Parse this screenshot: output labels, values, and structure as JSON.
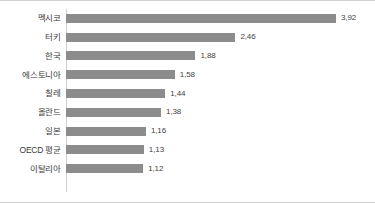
{
  "chart_data": {
    "type": "bar",
    "orientation": "horizontal",
    "title": "",
    "subtitle": "",
    "xlabel": "",
    "ylabel": "",
    "xlim": [
      0,
      4.4
    ],
    "grid": false,
    "legend": null,
    "value_label_format": "comma-decimal",
    "bar_color": "#8c8c8c",
    "categories": [
      "멕시코",
      "터키",
      "한국",
      "에스토니아",
      "칠레",
      "올란드",
      "일본",
      "OECD 평균",
      "이탈리아"
    ],
    "values": [
      3.92,
      2.46,
      1.88,
      1.58,
      1.44,
      1.38,
      1.16,
      1.13,
      1.12
    ],
    "value_labels": [
      "3,92",
      "2,46",
      "1,88",
      "1,58",
      "1,44",
      "1,38",
      "1,16",
      "1,13",
      "1,12"
    ],
    "rows": [
      {
        "label": "멕시코",
        "value": 3.92,
        "value_label": "3,92"
      },
      {
        "label": "터키",
        "value": 2.46,
        "value_label": "2,46"
      },
      {
        "label": "한국",
        "value": 1.88,
        "value_label": "1,88"
      },
      {
        "label": "에스토니아",
        "value": 1.58,
        "value_label": "1,58"
      },
      {
        "label": "칠레",
        "value": 1.44,
        "value_label": "1,44"
      },
      {
        "label": "올란드",
        "value": 1.38,
        "value_label": "1,38"
      },
      {
        "label": "일본",
        "value": 1.16,
        "value_label": "1,16"
      },
      {
        "label": "OECD 평균",
        "value": 1.13,
        "value_label": "1,13"
      },
      {
        "label": "이탈리아",
        "value": 1.12,
        "value_label": "1,12"
      }
    ]
  },
  "colors": {
    "bar": "#8c8c8c",
    "axis": "#cfcfcf",
    "frame_rule": "#d0d0d0",
    "label_text": "#3b3b3b",
    "value_text": "#3f3f3f"
  }
}
